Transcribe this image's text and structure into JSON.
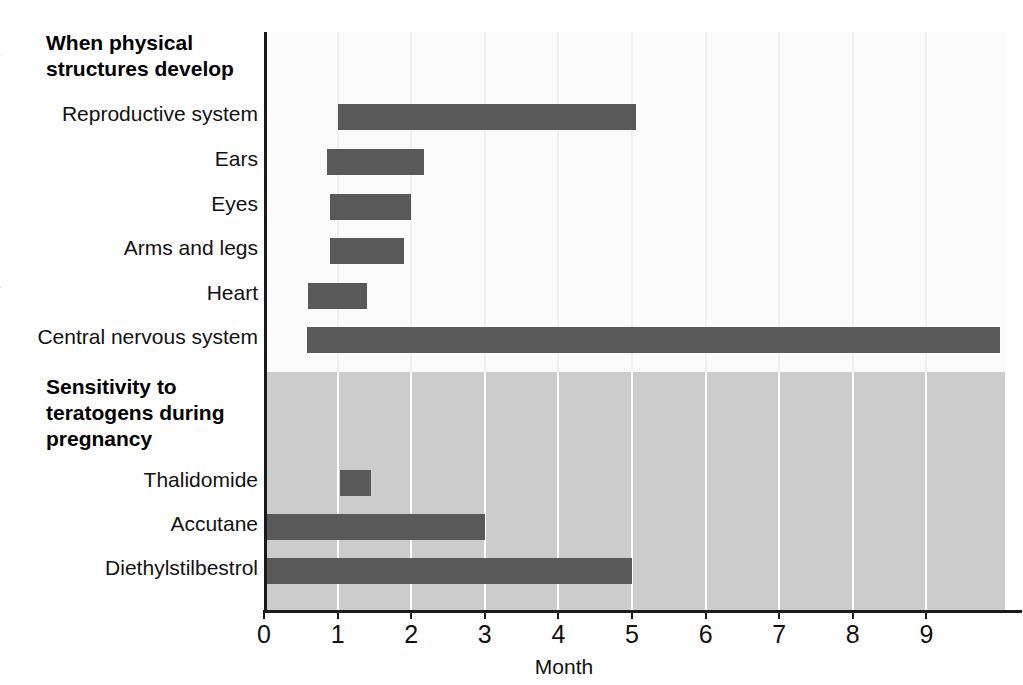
{
  "figure": {
    "width": 1023,
    "height": 685,
    "background": "#ffffff",
    "bar_color": "#595959",
    "upper_panel_color": "#fbfbfb",
    "lower_panel_color": "#cccccc",
    "axis_color": "#1a1a1a"
  },
  "sections": {
    "upper_title": "When physical\nstructures develop",
    "lower_title": "Sensitivity to\nteratogens during\npregnancy"
  },
  "axis": {
    "xlabel": "Month",
    "ticks": [
      "0",
      "1",
      "2",
      "3",
      "4",
      "5",
      "6",
      "7",
      "8",
      "9"
    ]
  },
  "labels": {
    "reproductive_system": "Reproductive system",
    "ears": "Ears",
    "eyes": "Eyes",
    "arms_and_legs": "Arms and legs",
    "heart": "Heart",
    "central_nervous_system": "Central nervous system",
    "thalidomide": "Thalidomide",
    "accutane": "Accutane",
    "diethylstilbestrol": "Diethylstilbestrol"
  },
  "edge_fragments": [
    {
      "text": "l",
      "top": 8
    },
    {
      "text": "n",
      "top": 37
    },
    {
      "text": ".",
      "top": 66
    },
    {
      "text": "e",
      "top": 124
    },
    {
      "text": "-",
      "top": 153
    },
    {
      "text": "s",
      "top": 182
    },
    {
      "text": "e",
      "top": 211
    },
    {
      "text": "s",
      "top": 240
    },
    {
      "text": "d",
      "top": 269
    },
    {
      "text": "e",
      "top": 298
    },
    {
      "text": "s",
      "top": 327
    }
  ],
  "chart_data": {
    "type": "bar",
    "orientation": "horizontal",
    "subtype": "range-bar-timeline",
    "xlabel": "Month",
    "ylabel": "",
    "xlim": [
      0,
      10
    ],
    "xticks": [
      0,
      1,
      2,
      3,
      4,
      5,
      6,
      7,
      8,
      9
    ],
    "grid": "vertical",
    "legend": "none",
    "panels": [
      {
        "name": "When physical structures develop",
        "background": "#fbfbfb",
        "bars": [
          {
            "label": "Reproductive system",
            "start": 1.0,
            "end": 5.05
          },
          {
            "label": "Ears",
            "start": 0.85,
            "end": 2.18
          },
          {
            "label": "Eyes",
            "start": 0.9,
            "end": 2.0
          },
          {
            "label": "Arms and legs",
            "start": 0.9,
            "end": 1.9
          },
          {
            "label": "Heart",
            "start": 0.6,
            "end": 1.4
          },
          {
            "label": "Central nervous system",
            "start": 0.58,
            "end": 10.0
          }
        ]
      },
      {
        "name": "Sensitivity to teratogens during pregnancy",
        "background": "#cccccc",
        "bars": [
          {
            "label": "Thalidomide",
            "start": 1.03,
            "end": 1.45
          },
          {
            "label": "Accutane",
            "start": 0.0,
            "end": 3.0
          },
          {
            "label": "Diethylstilbestrol",
            "start": 0.0,
            "end": 5.0
          }
        ]
      }
    ]
  },
  "geometry": {
    "plot_left": 264,
    "plot_top": 32,
    "plot_right": 1005,
    "plot_bottom": 610,
    "px_per_month": 73.6,
    "panel_split_y": 372,
    "rows": {
      "reproductive_system": 104,
      "ears": 149,
      "eyes": 194,
      "arms_and_legs": 238,
      "heart": 283,
      "central_nervous_system": 327,
      "thalidomide": 470,
      "accutane": 514,
      "diethylstilbestrol": 558
    }
  }
}
